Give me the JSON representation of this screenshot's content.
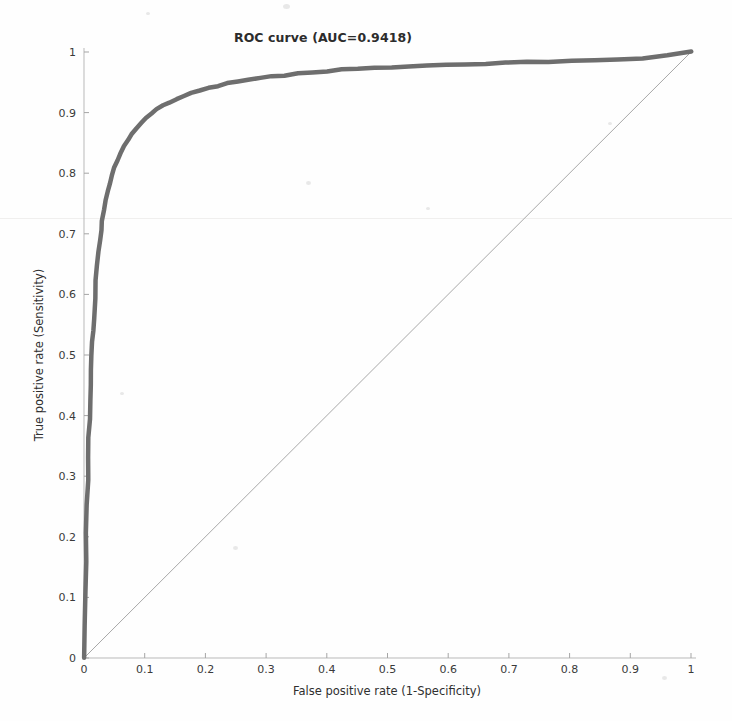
{
  "chart_data": {
    "type": "line",
    "title": "ROC curve (AUC=0.9418)",
    "xlabel": "False positive rate (1-Specificity)",
    "ylabel": "True positive rate (Sensitivity)",
    "xlim": [
      0,
      1
    ],
    "ylim": [
      0,
      1
    ],
    "grid": false,
    "legend": null,
    "auc": 0.9418,
    "xticks": [
      "0",
      "0.1",
      "0.2",
      "0.3",
      "0.4",
      "0.5",
      "0.6",
      "0.7",
      "0.8",
      "0.9",
      "1"
    ],
    "xtick_values": [
      0,
      0.1,
      0.2,
      0.3,
      0.4,
      0.5,
      0.6,
      0.7,
      0.8,
      0.9,
      1
    ],
    "yticks": [
      "0",
      "0.1",
      "0.2",
      "0.3",
      "0.4",
      "0.5",
      "0.6",
      "0.7",
      "0.8",
      "0.9",
      "1"
    ],
    "ytick_values": [
      0,
      0.1,
      0.2,
      0.3,
      0.4,
      0.5,
      0.6,
      0.7,
      0.8,
      0.9,
      1
    ],
    "series": [
      {
        "name": "ROC curve",
        "color": "#6e6e6e",
        "linewidth": 4.5,
        "x": [
          0.0,
          0.001,
          0.002,
          0.003,
          0.004,
          0.005,
          0.006,
          0.007,
          0.008,
          0.009,
          0.01,
          0.011,
          0.012,
          0.013,
          0.014,
          0.015,
          0.016,
          0.018,
          0.02,
          0.022,
          0.024,
          0.026,
          0.028,
          0.03,
          0.033,
          0.036,
          0.039,
          0.042,
          0.046,
          0.05,
          0.055,
          0.06,
          0.066,
          0.072,
          0.079,
          0.086,
          0.094,
          0.102,
          0.111,
          0.12,
          0.13,
          0.141,
          0.152,
          0.164,
          0.177,
          0.19,
          0.205,
          0.22,
          0.236,
          0.253,
          0.271,
          0.29,
          0.31,
          0.331,
          0.353,
          0.376,
          0.4,
          0.425,
          0.451,
          0.478,
          0.506,
          0.535,
          0.565,
          0.596,
          0.628,
          0.661,
          0.695,
          0.73,
          0.766,
          0.803,
          0.841,
          0.88,
          0.92,
          0.96,
          1.0
        ],
        "y": [
          0.0,
          0.055,
          0.11,
          0.16,
          0.208,
          0.252,
          0.293,
          0.33,
          0.364,
          0.395,
          0.424,
          0.451,
          0.476,
          0.499,
          0.521,
          0.541,
          0.56,
          0.594,
          0.623,
          0.648,
          0.67,
          0.689,
          0.706,
          0.721,
          0.74,
          0.756,
          0.77,
          0.782,
          0.796,
          0.808,
          0.821,
          0.832,
          0.844,
          0.854,
          0.865,
          0.874,
          0.883,
          0.891,
          0.899,
          0.905,
          0.911,
          0.917,
          0.922,
          0.927,
          0.932,
          0.936,
          0.94,
          0.944,
          0.948,
          0.951,
          0.954,
          0.957,
          0.96,
          0.962,
          0.965,
          0.967,
          0.969,
          0.971,
          0.972,
          0.974,
          0.975,
          0.977,
          0.978,
          0.979,
          0.98,
          0.981,
          0.982,
          0.983,
          0.984,
          0.985,
          0.986,
          0.988,
          0.99,
          0.994,
          1.0
        ]
      },
      {
        "name": "chance diagonal",
        "color": "#a8a8a8",
        "linewidth": 1,
        "x": [
          0,
          1
        ],
        "y": [
          0,
          1
        ]
      }
    ]
  },
  "axes": {
    "x_title": "False positive rate (1-Specificity)",
    "y_title": "True positive rate (Sensitivity)",
    "title": "ROC curve (AUC=0.9418)"
  }
}
